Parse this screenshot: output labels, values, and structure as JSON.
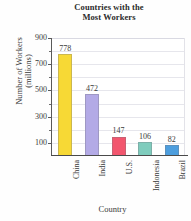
{
  "chart_data": {
    "type": "bar",
    "title": "Countries with the Most Workers",
    "title_line1": "Countries with the",
    "title_line2": "Most Workers",
    "xlabel": "Country",
    "ylabel": "Number of Workers (millions)",
    "ylabel_line1": "Number of Workers",
    "ylabel_line2": "(millions)",
    "categories": [
      "China",
      "India",
      "U.S.",
      "Indonesia",
      "Brazil"
    ],
    "values": [
      778,
      472,
      147,
      106,
      82
    ],
    "value_labels": [
      "778",
      "472",
      "147",
      "106",
      "82"
    ],
    "colors": [
      "#f7d935",
      "#b3aae6",
      "#f2566e",
      "#7fccbd",
      "#4d9ede"
    ],
    "ylim": [
      0,
      900
    ],
    "ytick_major": [
      900,
      700,
      500,
      300,
      100
    ],
    "ytick_major_labels": [
      "900",
      "700",
      "500",
      "300",
      "100"
    ],
    "ytick_minor": [
      800,
      600,
      400,
      200
    ],
    "grid": true,
    "grid_axis": "y",
    "legend": "none",
    "legend_position": "none"
  },
  "style": {
    "background": "#fefefe",
    "grid_color": "#e6e6ec",
    "axis_color": "#4a4a4a",
    "text_color": "#3a3a3a"
  }
}
